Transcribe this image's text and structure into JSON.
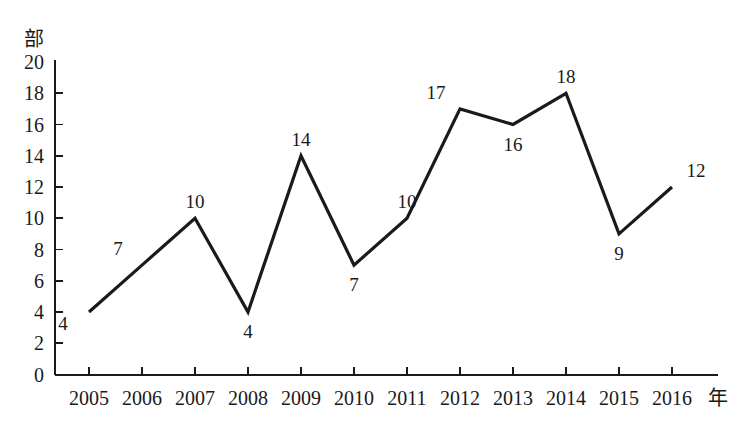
{
  "chart_data": {
    "type": "line",
    "title": "",
    "subtitle": "",
    "xlabel": "年",
    "ylabel": "部",
    "categories": [
      "2005",
      "2006",
      "2007",
      "2008",
      "2009",
      "2010",
      "2011",
      "2012",
      "2013",
      "2014",
      "2015",
      "2016"
    ],
    "values": [
      4,
      7,
      10,
      4,
      14,
      7,
      10,
      17,
      16,
      18,
      9,
      12
    ],
    "point_labels": [
      "4",
      "7",
      "10",
      "4",
      "14",
      "7",
      "10",
      "17",
      "16",
      "18",
      "9",
      "12"
    ],
    "ylim": [
      0,
      20
    ],
    "y_ticks": [
      "0",
      "2",
      "4",
      "6",
      "8",
      "10",
      "12",
      "14",
      "16",
      "18",
      "20"
    ],
    "grid": false,
    "legend": "none",
    "line_color": "#1a1a1a",
    "background_color": "#ffffff",
    "label_positions": [
      "below-left",
      "above-left",
      "above",
      "below",
      "above",
      "below",
      "above",
      "above-left",
      "below",
      "above",
      "below",
      "above-right"
    ]
  },
  "axis": {
    "y_unit": "部",
    "x_unit": "年"
  }
}
